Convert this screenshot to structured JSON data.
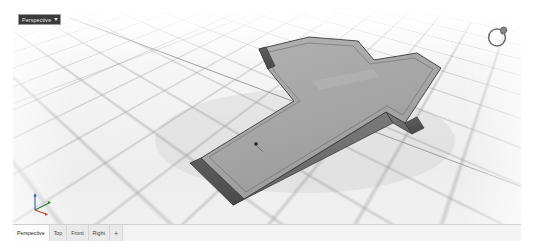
{
  "app": {
    "name": "Rhinoceros 3D Viewport",
    "viewport_label": "Perspective",
    "viewport_caret": "▾"
  },
  "colors": {
    "background": "#ffffff",
    "viewport_bg": "#f4f4f4",
    "grid_line": "#96989b",
    "world_axis": "#8d8f92",
    "model_top_face": "#a8a8a8",
    "model_side_face": "#6f6f6f",
    "model_end_face": "#4e4e4e",
    "model_edge": "#3a3a3a",
    "title_tab_bg": "#3a3a3a",
    "title_tab_text": "#e8e8e8",
    "tabbar_bg": "#f0f0f0",
    "tab_active_bg": "#fbfbfb",
    "axis_x": "#c0392b",
    "axis_y": "#277d34",
    "axis_z": "#2c5fa8",
    "point_marker": "#1a1a1a"
  },
  "viewport": {
    "title": "Perspective",
    "nav_widget_name": "view-rotation-ring",
    "axis_gizmo": {
      "x_label": "x",
      "y_label": "y",
      "z_label": "z"
    },
    "point_marker_label": ""
  },
  "tabbar": {
    "tabs": [
      {
        "label": "Perspective",
        "active": true
      },
      {
        "label": "Top",
        "active": false
      },
      {
        "label": "Front",
        "active": false
      },
      {
        "label": "Right",
        "active": false
      }
    ],
    "add_label": "+"
  },
  "model": {
    "name": "cross-solid",
    "description": "Extruded cross shaped solid with inset groove on top face",
    "shaded": true
  }
}
